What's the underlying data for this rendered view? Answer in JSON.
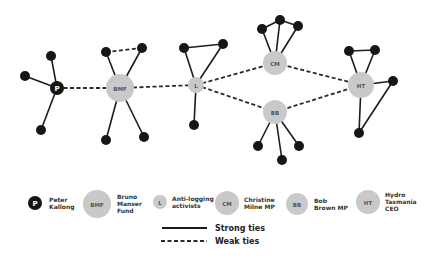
{
  "diagram": {
    "type": "social-network",
    "hubs": [
      {
        "id": "P",
        "label": "P",
        "name": "Peter Kallong",
        "x": 57,
        "y": 88,
        "r": 7,
        "style": "black"
      },
      {
        "id": "BMF",
        "label": "BMF",
        "name": "Bruno Manser Fund",
        "x": 120,
        "y": 88,
        "r": 14,
        "style": "gray"
      },
      {
        "id": "L",
        "label": "L",
        "name": "Anti-logging activists",
        "x": 196,
        "y": 85,
        "r": 8,
        "style": "gray"
      },
      {
        "id": "CM",
        "label": "CM",
        "name": "Christine Milne MP",
        "x": 275,
        "y": 63,
        "r": 12,
        "style": "gray"
      },
      {
        "id": "BB",
        "label": "BB",
        "name": "Bob Brown MP",
        "x": 275,
        "y": 112,
        "r": 12,
        "style": "gray"
      },
      {
        "id": "HT",
        "label": "HT",
        "name": "Hydro Tasmania CEO",
        "x": 361,
        "y": 85,
        "r": 13,
        "style": "gray"
      }
    ],
    "satellites": [
      {
        "id": "p1",
        "x": 51,
        "y": 56
      },
      {
        "id": "p2",
        "x": 25,
        "y": 76
      },
      {
        "id": "p3",
        "x": 41,
        "y": 130
      },
      {
        "id": "b1",
        "x": 106,
        "y": 52
      },
      {
        "id": "b2",
        "x": 142,
        "y": 48
      },
      {
        "id": "b3",
        "x": 106,
        "y": 140
      },
      {
        "id": "b4",
        "x": 144,
        "y": 137
      },
      {
        "id": "l1",
        "x": 184,
        "y": 48
      },
      {
        "id": "l2",
        "x": 223,
        "y": 44
      },
      {
        "id": "l3",
        "x": 194,
        "y": 125
      },
      {
        "id": "c1",
        "x": 262,
        "y": 29
      },
      {
        "id": "c2",
        "x": 280,
        "y": 20
      },
      {
        "id": "c3",
        "x": 298,
        "y": 26
      },
      {
        "id": "bb1",
        "x": 258,
        "y": 146
      },
      {
        "id": "bb2",
        "x": 282,
        "y": 160
      },
      {
        "id": "bb3",
        "x": 299,
        "y": 146
      },
      {
        "id": "h1",
        "x": 349,
        "y": 51
      },
      {
        "id": "h2",
        "x": 375,
        "y": 50
      },
      {
        "id": "h3",
        "x": 393,
        "y": 81
      },
      {
        "id": "h4",
        "x": 359,
        "y": 133
      }
    ],
    "strong_edges": [
      [
        "P",
        "p1"
      ],
      [
        "P",
        "p2"
      ],
      [
        "P",
        "p3"
      ],
      [
        "BMF",
        "b1"
      ],
      [
        "BMF",
        "b2"
      ],
      [
        "BMF",
        "b3"
      ],
      [
        "BMF",
        "b4"
      ],
      [
        "L",
        "l1"
      ],
      [
        "L",
        "l2"
      ],
      [
        "L",
        "l3"
      ],
      [
        "l1",
        "l2"
      ],
      [
        "CM",
        "c1"
      ],
      [
        "CM",
        "c2"
      ],
      [
        "CM",
        "c3"
      ],
      [
        "c1",
        "c2"
      ],
      [
        "c2",
        "c3"
      ],
      [
        "BB",
        "bb1"
      ],
      [
        "BB",
        "bb2"
      ],
      [
        "BB",
        "bb3"
      ],
      [
        "HT",
        "h1"
      ],
      [
        "HT",
        "h2"
      ],
      [
        "h1",
        "h2"
      ],
      [
        "HT",
        "h3"
      ],
      [
        "HT",
        "h4"
      ],
      [
        "h3",
        "h4"
      ]
    ],
    "weak_edges": [
      [
        "P",
        "BMF"
      ],
      [
        "BMF",
        "L"
      ],
      [
        "b1",
        "b2"
      ],
      [
        "L",
        "CM"
      ],
      [
        "L",
        "BB"
      ],
      [
        "CM",
        "HT"
      ],
      [
        "BB",
        "HT"
      ]
    ]
  },
  "legend": {
    "nodes": [
      {
        "label": "P",
        "lines": [
          "Peter",
          "Kallong"
        ],
        "cx": 35,
        "cy": 203,
        "r": 7,
        "style": "black",
        "tx": 49
      },
      {
        "label": "BMF",
        "lines": [
          "Bruno",
          "Manser",
          "Fund"
        ],
        "cx": 97,
        "cy": 204,
        "r": 14,
        "style": "gray",
        "tx": 117
      },
      {
        "label": "L",
        "lines": [
          "Anti-logging",
          "activists"
        ],
        "cx": 160,
        "cy": 202,
        "r": 7,
        "style": "gray",
        "tx": 172
      },
      {
        "label": "CM",
        "lines": [
          "Christine",
          "Milne MP"
        ],
        "cx": 227,
        "cy": 203,
        "r": 12,
        "style": "gray",
        "tx": 244
      },
      {
        "label": "BB",
        "lines": [
          "Bob",
          "Brown MP"
        ],
        "cx": 297,
        "cy": 204,
        "r": 11,
        "style": "gray",
        "tx": 314
      },
      {
        "label": "HT",
        "lines": [
          "Hydro",
          "Tasmania",
          "CEO"
        ],
        "cx": 368,
        "cy": 202,
        "r": 12,
        "style": "gray",
        "tx": 385
      }
    ],
    "strong_label": "Strong ties",
    "weak_label": "Weak ties"
  },
  "colors": {
    "background": "#ffffff",
    "hub_gray": "#c9c9c9",
    "hub_black": "#141414",
    "satellite": "#161616",
    "edge": "#1c1c1c"
  }
}
